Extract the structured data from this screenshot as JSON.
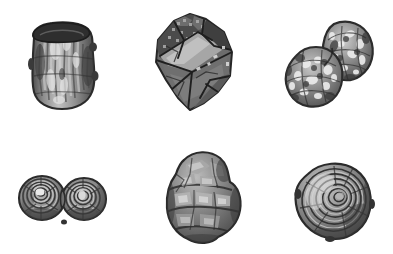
{
  "figure": {
    "title": "",
    "caption": "",
    "background_color": "#ffffff",
    "width": 393,
    "height": 254,
    "layout": "2 rows x 3 columns grid of rendered 3D particle surfaces",
    "rows": 2,
    "columns": 3
  },
  "palette": {
    "background": "#ffffff",
    "outline_dark": "#2b2b2b",
    "shadow": "#4a4a4a",
    "midtone": "#8a8a8a",
    "light": "#bdbdbd",
    "highlight": "#e8e8e8",
    "facet_dark": "#555555",
    "facet_mid": "#7d7d7d",
    "speckle_bright": "#f2f2f2"
  },
  "objects": [
    {
      "id": "particle-1",
      "name": "cylindrical-particle",
      "label": "",
      "row": 1,
      "column": 1,
      "shape": "cylinder",
      "description": "Upright rough cylinder with dark elliptical rim at top and vertical streaked surface texture",
      "bbox": {
        "x": 32,
        "y": 22,
        "width": 62,
        "height": 86
      },
      "base_gray": "#8e8e8e",
      "rim_gray": "#2f2f2f"
    },
    {
      "id": "particle-2",
      "name": "angular-faceted-particle",
      "label": "",
      "row": 1,
      "column": 2,
      "shape": "faceted-polyhedron",
      "description": "Dark angular chunk with flat planar facets and a bright diagonal band across the middle",
      "bbox": {
        "x": 152,
        "y": 14,
        "width": 88,
        "height": 100
      },
      "base_gray": "#6a6a6a",
      "rim_gray": "#333333"
    },
    {
      "id": "particle-3",
      "name": "diagonal-doublet-particle",
      "label": "",
      "row": 1,
      "column": 3,
      "shape": "two-lobe-agglomerate",
      "description": "Two fused rounded lobes arranged diagonally, heavily mottled with bright speckles",
      "bbox": {
        "x": 282,
        "y": 18,
        "width": 94,
        "height": 94
      },
      "base_gray": "#8a8a8a",
      "rim_gray": "#3a3a3a"
    },
    {
      "id": "particle-4",
      "name": "symmetric-doublet-particle",
      "label": "",
      "row": 2,
      "column": 1,
      "shape": "two-sphere-doublet",
      "description": "Two near-equal spheres side by side joined at a narrow neck, each with concentric contour rings and bright centers",
      "bbox": {
        "x": 20,
        "y": 170,
        "width": 88,
        "height": 54
      },
      "base_gray": "#858585",
      "rim_gray": "#343434"
    },
    {
      "id": "particle-5",
      "name": "lumpy-stacked-particle",
      "label": "",
      "row": 2,
      "column": 2,
      "shape": "irregular-lobed-mass",
      "description": "Tall lumpy rounded mass with stacked horizontal bulges and blocky facet highlights",
      "bbox": {
        "x": 163,
        "y": 152,
        "width": 78,
        "height": 92
      },
      "base_gray": "#7e7e7e",
      "rim_gray": "#303030"
    },
    {
      "id": "particle-6",
      "name": "spheroidal-particle",
      "label": "",
      "row": 2,
      "column": 3,
      "shape": "near-spherical-blob",
      "description": "Tilted near-spherical blob with swirling concentric ridge contours, brighter toward the upper left",
      "bbox": {
        "x": 292,
        "y": 158,
        "width": 82,
        "height": 84
      },
      "base_gray": "#8c8c8c",
      "rim_gray": "#343434"
    }
  ]
}
